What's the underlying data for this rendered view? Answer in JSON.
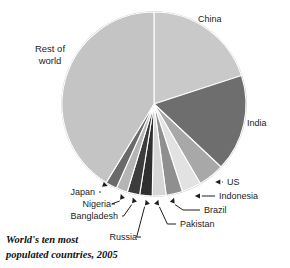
{
  "figure": {
    "caption_line1": "World's ten most",
    "caption_line2": "populated countries, 2005",
    "rest_label_line1": "Rest of",
    "rest_label_line2": "world"
  },
  "chart_data": {
    "type": "pie",
    "title": "World's ten most populated countries, 2005",
    "xlabel": "",
    "ylabel": "",
    "grid": false,
    "legend": "none",
    "label_style": "callout-arrows",
    "start_angle_deg": 0,
    "direction": "clockwise",
    "categories": [
      "China",
      "India",
      "US",
      "Indonesia",
      "Brazil",
      "Pakistan",
      "Russia",
      "Bangladesh",
      "Nigeria",
      "Japan",
      "Rest of world"
    ],
    "values": [
      20.0,
      17.0,
      4.6,
      3.4,
      2.9,
      2.4,
      2.2,
      2.2,
      2.0,
      2.0,
      41.3
    ],
    "unit": "percent of world population",
    "colors": [
      "#c9c9c9",
      "#6e6e6e",
      "#a8a8a8",
      "#e2e2e2",
      "#8f8f8f",
      "#d6d6d6",
      "#2f2f2f",
      "#3c3c3c",
      "#b5b5b5",
      "#6a6a6a",
      "#c4c4c4"
    ],
    "slices": [
      {
        "label": "China",
        "value": 20.0,
        "color": "#c9c9c9",
        "start_deg": 0.0,
        "end_deg": 72.0
      },
      {
        "label": "India",
        "value": 17.0,
        "color": "#6e6e6e",
        "start_deg": 72.0,
        "end_deg": 133.2
      },
      {
        "label": "US",
        "value": 4.6,
        "color": "#a8a8a8",
        "start_deg": 133.2,
        "end_deg": 149.8
      },
      {
        "label": "Indonesia",
        "value": 3.4,
        "color": "#e2e2e2",
        "start_deg": 149.8,
        "end_deg": 162.0
      },
      {
        "label": "Brazil",
        "value": 2.9,
        "color": "#8f8f8f",
        "start_deg": 162.0,
        "end_deg": 172.4
      },
      {
        "label": "Pakistan",
        "value": 2.4,
        "color": "#d6d6d6",
        "start_deg": 172.4,
        "end_deg": 181.1
      },
      {
        "label": "Russia",
        "value": 2.2,
        "color": "#2f2f2f",
        "start_deg": 181.1,
        "end_deg": 189.0
      },
      {
        "label": "Bangladesh",
        "value": 2.2,
        "color": "#3c3c3c",
        "start_deg": 189.0,
        "end_deg": 196.9
      },
      {
        "label": "Nigeria",
        "value": 2.0,
        "color": "#b5b5b5",
        "start_deg": 196.9,
        "end_deg": 204.1
      },
      {
        "label": "Japan",
        "value": 2.0,
        "color": "#6a6a6a",
        "start_deg": 204.1,
        "end_deg": 211.3
      },
      {
        "label": "Rest of world",
        "value": 41.3,
        "color": "#c4c4c4",
        "start_deg": 211.3,
        "end_deg": 360.0
      }
    ],
    "callouts": [
      {
        "label": "China",
        "side": "right",
        "text_x": 198,
        "text_y": 22
      },
      {
        "label": "India",
        "side": "right",
        "text_x": 247,
        "text_y": 126
      },
      {
        "label": "US",
        "side": "right",
        "text_x": 227,
        "text_y": 185
      },
      {
        "label": "Indonesia",
        "side": "right",
        "text_x": 219,
        "text_y": 199
      },
      {
        "label": "Brazil",
        "side": "right",
        "text_x": 204,
        "text_y": 213
      },
      {
        "label": "Pakistan",
        "side": "right",
        "text_x": 180,
        "text_y": 227
      },
      {
        "label": "Russia",
        "side": "left",
        "text_x": 137,
        "text_y": 240
      },
      {
        "label": "Bangladesh",
        "side": "left",
        "text_x": 118,
        "text_y": 219
      },
      {
        "label": "Nigeria",
        "side": "left",
        "text_x": 111,
        "text_y": 207
      },
      {
        "label": "Japan",
        "side": "left",
        "text_x": 95,
        "text_y": 195
      }
    ]
  }
}
